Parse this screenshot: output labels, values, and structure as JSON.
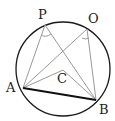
{
  "diagram": {
    "labels": {
      "P": "P",
      "O": "O",
      "A": "A",
      "B": "B",
      "C": "C"
    },
    "colors": {
      "circle": "#1a1a1a",
      "chord": "#111111",
      "lines": "#9a9a9a",
      "text": "#222222"
    }
  }
}
